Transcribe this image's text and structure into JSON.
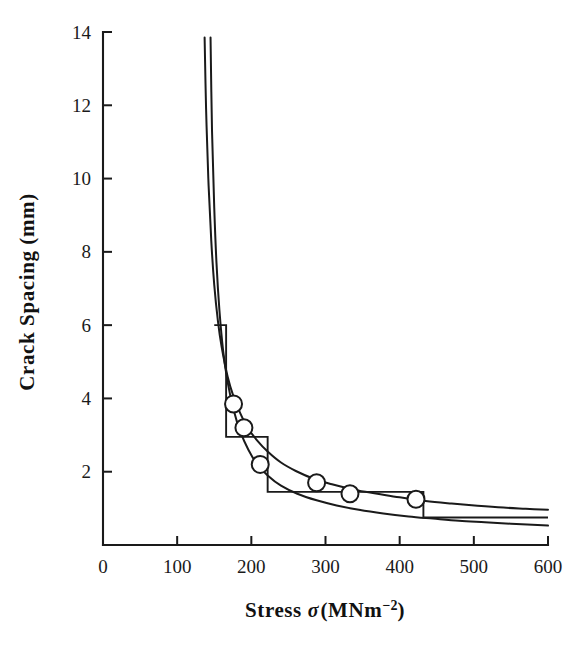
{
  "chart_data": {
    "type": "line",
    "title": "",
    "xlabel": "Stress σ(MNm⁻²)",
    "xlabel_parts": {
      "lead": "Stress ",
      "symbol": "σ",
      "open": "(MNm",
      "superscript": "−2",
      "close": ")"
    },
    "ylabel": "Crack Spacing (mm)",
    "xlim": [
      0,
      600
    ],
    "ylim": [
      0,
      14
    ],
    "xticks": [
      0,
      100,
      200,
      300,
      400,
      500,
      600
    ],
    "yticks": [
      0,
      2,
      4,
      6,
      8,
      10,
      12,
      14
    ],
    "xtick_labels": [
      "0",
      "100",
      "200",
      "300",
      "400",
      "500",
      "600"
    ],
    "ytick_labels": [
      "",
      "2",
      "4",
      "6",
      "8",
      "10",
      "12",
      "14"
    ],
    "grid": false,
    "legend": "none",
    "tick_direction": "in",
    "axis_color": "#1a1a1a",
    "series": [
      {
        "name": "upper-bound-curve",
        "type": "line",
        "style": "solid",
        "x": [
          137,
          139,
          142,
          146,
          150,
          155,
          160,
          168,
          176,
          185,
          195,
          208,
          222,
          240,
          260,
          285,
          310,
          340,
          370,
          400,
          435,
          470,
          505,
          540,
          570,
          600
        ],
        "y": [
          13.85,
          11.9,
          10.0,
          8.3,
          7.1,
          6.1,
          5.4,
          4.6,
          4.05,
          3.6,
          3.2,
          2.85,
          2.55,
          2.25,
          2.02,
          1.8,
          1.65,
          1.5,
          1.4,
          1.3,
          1.2,
          1.13,
          1.07,
          1.02,
          0.99,
          0.96
        ]
      },
      {
        "name": "lower-bound-curve",
        "type": "line",
        "style": "solid",
        "x": [
          145,
          147,
          150,
          153,
          157,
          162,
          168,
          176,
          185,
          196,
          208,
          222,
          240,
          262,
          288,
          315,
          345,
          378,
          412,
          445,
          480,
          515,
          550,
          600
        ],
        "y": [
          13.85,
          11.3,
          9.2,
          7.7,
          6.4,
          5.3,
          4.45,
          3.7,
          3.1,
          2.6,
          2.2,
          1.9,
          1.62,
          1.4,
          1.22,
          1.08,
          0.96,
          0.86,
          0.78,
          0.72,
          0.66,
          0.62,
          0.58,
          0.53
        ]
      },
      {
        "name": "step-prediction",
        "type": "step",
        "style": "solid",
        "steps": [
          {
            "x_start": 150,
            "x_end": 166,
            "y": 6.0
          },
          {
            "x_start": 166,
            "x_end": 222,
            "y": 2.95
          },
          {
            "x_start": 222,
            "x_end": 432,
            "y": 1.45
          },
          {
            "x_start": 432,
            "x_end": 600,
            "y": 0.75
          }
        ]
      },
      {
        "name": "measured-data-points",
        "type": "scatter",
        "marker": "open-circle",
        "points": [
          {
            "x": 176,
            "y": 3.85
          },
          {
            "x": 190,
            "y": 3.2
          },
          {
            "x": 212,
            "y": 2.2
          },
          {
            "x": 288,
            "y": 1.7
          },
          {
            "x": 333,
            "y": 1.4
          },
          {
            "x": 422,
            "y": 1.25
          }
        ]
      }
    ]
  },
  "axes": {
    "x_title": "Stress σ(MNm⁻²)",
    "y_title": "Crack Spacing (mm)"
  }
}
